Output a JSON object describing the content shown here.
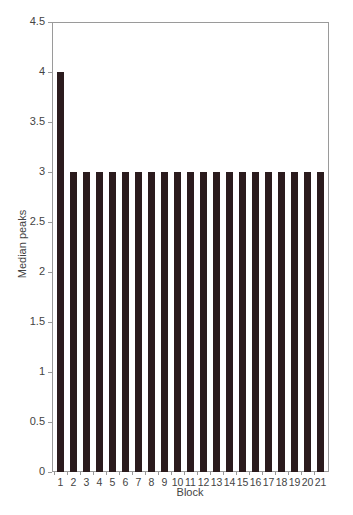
{
  "chart_data": {
    "type": "bar",
    "title": "",
    "xlabel": "Block",
    "ylabel": "Median peaks",
    "ylim": [
      0,
      4.5
    ],
    "yticks": [
      0,
      0.5,
      1,
      1.5,
      2,
      2.5,
      3,
      3.5,
      4,
      4.5
    ],
    "ytick_labels": [
      "0",
      "0.5",
      "1",
      "1.5",
      "2",
      "2.5",
      "3",
      "3.5",
      "4",
      "4.5"
    ],
    "grid": false,
    "legend": null,
    "categories": [
      "1",
      "2",
      "3",
      "4",
      "5",
      "6",
      "7",
      "8",
      "9",
      "10",
      "11",
      "12",
      "13",
      "14",
      "15",
      "16",
      "17",
      "18",
      "19",
      "20",
      "21"
    ],
    "values": [
      4,
      3,
      3,
      3,
      3,
      3,
      3,
      3,
      3,
      3,
      3,
      3,
      3,
      3,
      3,
      3,
      3,
      3,
      3,
      3,
      3
    ],
    "bar_color": "#2b1b1d"
  }
}
